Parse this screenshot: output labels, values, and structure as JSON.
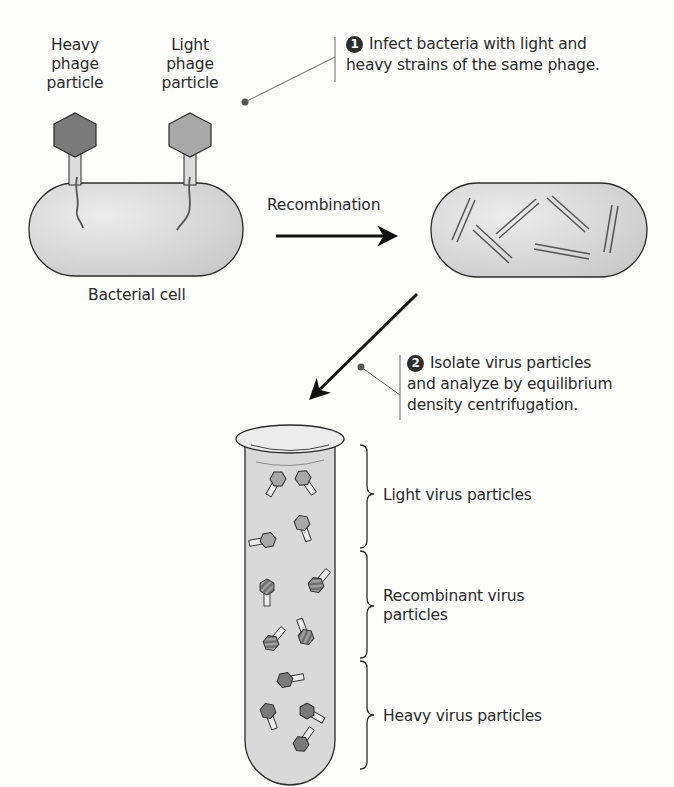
{
  "labels": {
    "heavy_phage": [
      "Heavy",
      "phage",
      "particle"
    ],
    "light_phage": [
      "Light",
      "phage",
      "particle"
    ],
    "bacterial_cell": "Bacterial cell",
    "recombination": "Recombination"
  },
  "steps": [
    {
      "number": "1",
      "text_line1": "Infect bacteria with light and",
      "text_line2": "heavy strains of the same phage."
    },
    {
      "number": "2",
      "text_line1": "Isolate virus particles",
      "text_line2": "and analyze by equilibrium",
      "text_line3": "density centrifugation."
    }
  ],
  "tube_bands": [
    {
      "label": "Light virus particles"
    },
    {
      "label_line1": "Recombinant virus",
      "label_line2": "particles"
    },
    {
      "label": "Heavy virus particles"
    }
  ],
  "colors": {
    "heavy_head": "#7a7a7a",
    "light_head": "#a8a8a8",
    "cell_fill": "#d6d6d6",
    "tube_fill": "#d9d9d9",
    "outline": "#2b2b2b"
  }
}
